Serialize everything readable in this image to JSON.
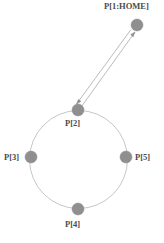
{
  "diagram": {
    "type": "robot-path-waypoint-diagram",
    "background_color": "#ffffff",
    "node_fill_color": "#8f8f8f",
    "node_stroke_color": "#8a8a8a",
    "path_stroke_color": "#b5b5b5",
    "arrow_stroke_color": "#a8a8a8",
    "label_color": "#4a4a4a",
    "nodes": [
      {
        "id": "home",
        "label": "P[1:HOME]",
        "cx": 137,
        "cy": 25,
        "r": 6,
        "label_position": "above"
      },
      {
        "id": "p2",
        "label": "P[2]",
        "cx": 78,
        "cy": 110,
        "r": 6,
        "label_position": "below"
      },
      {
        "id": "p3",
        "label": "P[3]",
        "cx": 31,
        "cy": 157,
        "r": 6,
        "label_position": "left"
      },
      {
        "id": "p5",
        "label": "P[5]",
        "cx": 126,
        "cy": 157,
        "r": 6,
        "label_position": "right"
      },
      {
        "id": "p4",
        "label": "P[4]",
        "cx": 78,
        "cy": 209,
        "r": 6,
        "label_position": "below"
      }
    ],
    "circular_path": {
      "cx": 78.5,
      "cy": 159.5,
      "r": 49,
      "stroke_width": 0.8
    },
    "connectors": [
      {
        "id": "home-to-p2",
        "from": "home",
        "to": "p2",
        "direction": "down-left",
        "arrowhead": "at-p2",
        "stroke_width": 0.8
      },
      {
        "id": "p2-to-home",
        "from": "p2",
        "to": "home",
        "direction": "up-right",
        "arrowhead": "at-home",
        "stroke_width": 0.8
      }
    ]
  }
}
